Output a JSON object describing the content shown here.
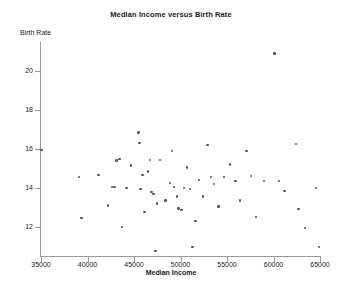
{
  "chart_data": {
    "type": "scatter",
    "title": "Median Income versus Birth Rate",
    "xlabel": "Median Income",
    "ylabel": "Birth Rate",
    "xlim": [
      35000,
      65000
    ],
    "ylim": [
      10.5,
      21.5
    ],
    "xticks": [
      35000,
      40000,
      45000,
      50000,
      55000,
      60000,
      65000
    ],
    "xtick_labels": [
      "35000",
      "40000",
      "45000",
      "50000",
      "55000",
      "60000",
      "65000"
    ],
    "yticks": [
      12,
      14,
      16,
      18,
      20
    ],
    "ytick_labels": [
      "12",
      "14",
      "16",
      "18",
      "20"
    ],
    "grid": false,
    "legend": null,
    "marker_color": "#565656",
    "axis_color": "#9a9a9a",
    "points": [
      {
        "x": 35050,
        "y": 15.95
      },
      {
        "x": 39100,
        "y": 14.55
      },
      {
        "x": 39350,
        "y": 12.45
      },
      {
        "x": 41200,
        "y": 14.65
      },
      {
        "x": 42200,
        "y": 13.1
      },
      {
        "x": 42650,
        "y": 14.05
      },
      {
        "x": 42900,
        "y": 14.05
      },
      {
        "x": 43100,
        "y": 15.4
      },
      {
        "x": 43450,
        "y": 15.5
      },
      {
        "x": 43700,
        "y": 12.0
      },
      {
        "x": 44200,
        "y": 14.0
      },
      {
        "x": 44650,
        "y": 15.15
      },
      {
        "x": 45500,
        "y": 16.85
      },
      {
        "x": 45600,
        "y": 16.3
      },
      {
        "x": 45700,
        "y": 13.95
      },
      {
        "x": 45900,
        "y": 14.65
      },
      {
        "x": 46150,
        "y": 12.75
      },
      {
        "x": 46500,
        "y": 14.85
      },
      {
        "x": 46700,
        "y": 15.45
      },
      {
        "x": 46900,
        "y": 13.8
      },
      {
        "x": 47100,
        "y": 13.7
      },
      {
        "x": 47300,
        "y": 10.75
      },
      {
        "x": 47500,
        "y": 13.2
      },
      {
        "x": 47800,
        "y": 15.45
      },
      {
        "x": 48400,
        "y": 13.35
      },
      {
        "x": 48900,
        "y": 14.25
      },
      {
        "x": 49100,
        "y": 15.9
      },
      {
        "x": 49300,
        "y": 14.05
      },
      {
        "x": 49600,
        "y": 13.55
      },
      {
        "x": 49800,
        "y": 12.95
      },
      {
        "x": 50100,
        "y": 12.85
      },
      {
        "x": 50400,
        "y": 14.0
      },
      {
        "x": 50700,
        "y": 15.05
      },
      {
        "x": 51000,
        "y": 13.95
      },
      {
        "x": 51300,
        "y": 10.95
      },
      {
        "x": 51600,
        "y": 12.3
      },
      {
        "x": 52000,
        "y": 14.4
      },
      {
        "x": 52400,
        "y": 13.55
      },
      {
        "x": 52900,
        "y": 16.2
      },
      {
        "x": 53300,
        "y": 14.55
      },
      {
        "x": 53600,
        "y": 14.2
      },
      {
        "x": 54100,
        "y": 13.05
      },
      {
        "x": 54700,
        "y": 14.55
      },
      {
        "x": 55300,
        "y": 15.2
      },
      {
        "x": 55900,
        "y": 14.35
      },
      {
        "x": 56400,
        "y": 13.35
      },
      {
        "x": 57100,
        "y": 15.9
      },
      {
        "x": 57600,
        "y": 14.6
      },
      {
        "x": 58100,
        "y": 12.5
      },
      {
        "x": 59000,
        "y": 14.35
      },
      {
        "x": 60100,
        "y": 20.9
      },
      {
        "x": 60600,
        "y": 14.35
      },
      {
        "x": 61200,
        "y": 13.85
      },
      {
        "x": 62400,
        "y": 16.25
      },
      {
        "x": 62700,
        "y": 12.9
      },
      {
        "x": 63400,
        "y": 11.95
      },
      {
        "x": 64600,
        "y": 14.0
      },
      {
        "x": 64900,
        "y": 10.95
      }
    ]
  }
}
